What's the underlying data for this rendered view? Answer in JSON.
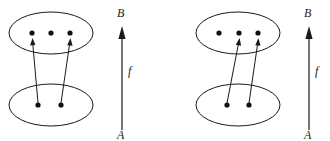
{
  "figure": {
    "kind": "function-mapping-diagram",
    "panel_count": 2,
    "colors": {
      "background": "#ffffff",
      "stroke": "#1a1a1a",
      "dot": "#111111"
    },
    "panels": [
      {
        "id": "left",
        "codomain": {
          "label": "B",
          "element_count": 3,
          "elements": [
            "b1",
            "b2",
            "b3"
          ]
        },
        "domain": {
          "label": "A",
          "element_count": 2,
          "elements": [
            "a1",
            "a2"
          ]
        },
        "function_label": "f",
        "axis_from_label": "A",
        "axis_to_label": "B",
        "mappings": [
          {
            "from": "a1",
            "to": "b1"
          },
          {
            "from": "a2",
            "to": "b3"
          }
        ],
        "unmapped_codomain_elements": [
          "b2"
        ]
      },
      {
        "id": "right",
        "codomain": {
          "label": "B",
          "element_count": 3,
          "elements": [
            "b1",
            "b2",
            "b3"
          ]
        },
        "domain": {
          "label": "A",
          "element_count": 2,
          "elements": [
            "a1",
            "a2"
          ]
        },
        "function_label": "f",
        "axis_from_label": "A",
        "axis_to_label": "B",
        "mappings": [
          {
            "from": "a1",
            "to": "b2"
          },
          {
            "from": "a2",
            "to": "b3"
          }
        ],
        "unmapped_codomain_elements": [
          "b1"
        ]
      }
    ]
  }
}
